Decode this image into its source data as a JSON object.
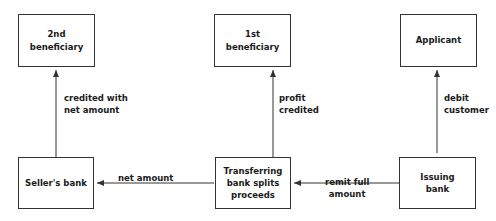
{
  "diagram": {
    "nodes": [
      {
        "id": "second_beneficiary",
        "lines": [
          "2nd",
          "beneficiary"
        ]
      },
      {
        "id": "first_beneficiary",
        "lines": [
          "1st",
          "beneficiary"
        ]
      },
      {
        "id": "applicant",
        "lines": [
          "Applicant"
        ]
      },
      {
        "id": "sellers_bank",
        "lines": [
          "Seller's bank"
        ]
      },
      {
        "id": "transferring_bank",
        "lines": [
          "Transferring",
          "bank splits",
          "proceeds"
        ]
      },
      {
        "id": "issuing_bank",
        "lines": [
          "Issuing",
          "bank"
        ]
      }
    ],
    "edges": [
      {
        "from": "sellers_bank",
        "to": "second_beneficiary",
        "lines": [
          "credited with",
          "net amount"
        ]
      },
      {
        "from": "transferring_bank",
        "to": "first_beneficiary",
        "lines": [
          "profit",
          "credited"
        ]
      },
      {
        "from": "issuing_bank",
        "to": "applicant",
        "lines": [
          "debit",
          "customer"
        ]
      },
      {
        "from": "transferring_bank",
        "to": "sellers_bank",
        "lines": [
          "net amount"
        ]
      },
      {
        "from": "issuing_bank",
        "to": "transferring_bank",
        "lines": [
          "remit full",
          "amount"
        ]
      }
    ],
    "colors": {
      "line": "#333333",
      "text": "#1a1a1a",
      "background": "#ffffff"
    }
  }
}
